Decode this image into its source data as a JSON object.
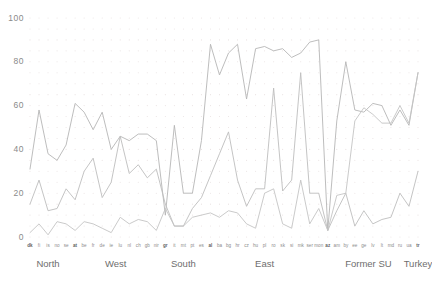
{
  "chart_data": {
    "type": "line",
    "title": "",
    "subtitle": "",
    "xlabel": "",
    "ylabel": "",
    "ylim": [
      0,
      100
    ],
    "yticks": [
      0,
      20,
      40,
      60,
      80,
      100
    ],
    "grid": "dotted",
    "legend": "none",
    "categories": [
      "dk",
      "fi",
      "is",
      "no",
      "se",
      "at",
      "be",
      "fr",
      "de",
      "ie",
      "lu",
      "nl",
      "ch",
      "gb",
      "nir",
      "gr",
      "it",
      "mt",
      "pt",
      "es",
      "al",
      "ba",
      "bg",
      "hr",
      "cz",
      "hu",
      "pl",
      "ro",
      "sk",
      "si",
      "mk",
      "ser",
      "mon",
      "az",
      "am",
      "by",
      "ee",
      "ge",
      "lv",
      "lt",
      "md",
      "ru",
      "ua",
      "tr"
    ],
    "groups": [
      {
        "label": "North",
        "start": "dk",
        "count": 5
      },
      {
        "label": "West",
        "start": "at",
        "count": 10
      },
      {
        "label": "South",
        "start": "gr",
        "count": 5
      },
      {
        "label": "East",
        "start": "al",
        "count": 13
      },
      {
        "label": "Former SU",
        "start": "az",
        "count": 10
      },
      {
        "label": "Turkey",
        "start": "tr",
        "count": 1
      }
    ],
    "series": [
      {
        "name": "series-1",
        "color": "#b5b5b5",
        "values": [
          31,
          58,
          38,
          35,
          42,
          61,
          57,
          49,
          57,
          40,
          46,
          44,
          47,
          47,
          44,
          10,
          51,
          20,
          20,
          44,
          88,
          74,
          84,
          88,
          63,
          86,
          87,
          85,
          86,
          82,
          84,
          89,
          90,
          3,
          53,
          80,
          58,
          57,
          61,
          60,
          51,
          58,
          51,
          75
        ]
      },
      {
        "name": "series-2",
        "color": "#bdbdbd",
        "values": [
          15,
          26,
          12,
          13,
          22,
          17,
          30,
          36,
          18,
          25,
          46,
          29,
          33,
          27,
          31,
          15,
          5,
          5,
          13,
          18,
          28,
          38,
          48,
          26,
          14,
          22,
          22,
          68,
          21,
          26,
          75,
          20,
          20,
          3,
          12,
          20,
          5,
          12,
          6,
          8,
          9,
          20,
          14,
          30
        ]
      },
      {
        "name": "series-3",
        "color": "#c4c4c4",
        "values": [
          2,
          6,
          1,
          7,
          6,
          3,
          7,
          6,
          4,
          2,
          9,
          6,
          8,
          7,
          3,
          13,
          5,
          5,
          9,
          10,
          11,
          9,
          12,
          11,
          6,
          4,
          20,
          22,
          6,
          4,
          26,
          6,
          13,
          3,
          19,
          20,
          53,
          59,
          56,
          52,
          52,
          60,
          52,
          75
        ]
      }
    ]
  }
}
